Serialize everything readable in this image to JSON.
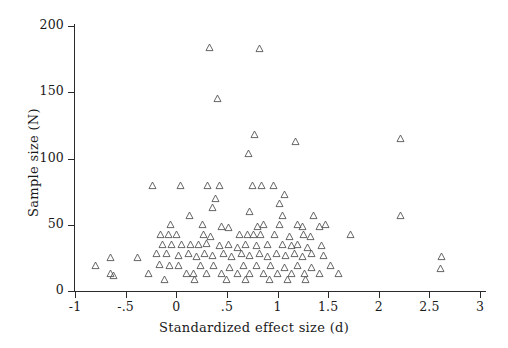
{
  "chart_data": {
    "type": "scatter",
    "title": "",
    "xlabel": "Standardized effect size (d)",
    "ylabel": "Sample size (N)",
    "xlim": [
      -1,
      3
    ],
    "ylim": [
      0,
      200
    ],
    "xticks": [
      -1,
      -0.5,
      0,
      0.5,
      1,
      1.5,
      2,
      2.5,
      3
    ],
    "xticklabels": [
      "-1",
      "-.5",
      "0",
      ".5",
      "1",
      "1.5",
      "2",
      "2.5",
      "3"
    ],
    "yticks": [
      0,
      50,
      100,
      150,
      200
    ],
    "yticklabels": [
      "0",
      "50",
      "100",
      "150",
      "200"
    ],
    "grid": false,
    "legend": false,
    "marker": "triangle-up-open",
    "marker_color": "#555555",
    "series": [
      {
        "name": "studies",
        "points": [
          [
            0.33,
            184
          ],
          [
            0.82,
            183
          ],
          [
            0.41,
            145
          ],
          [
            1.18,
            113
          ],
          [
            0.71,
            104
          ],
          [
            0.77,
            118
          ],
          [
            2.21,
            115
          ],
          [
            -0.23,
            80
          ],
          [
            0.04,
            80
          ],
          [
            0.31,
            80
          ],
          [
            0.43,
            80
          ],
          [
            0.75,
            80
          ],
          [
            0.84,
            80
          ],
          [
            0.96,
            80
          ],
          [
            1.07,
            73
          ],
          [
            1.02,
            66
          ],
          [
            0.39,
            70
          ],
          [
            0.36,
            63
          ],
          [
            0.13,
            57
          ],
          [
            0.72,
            60
          ],
          [
            1.05,
            57
          ],
          [
            1.36,
            57
          ],
          [
            2.21,
            57
          ],
          [
            -0.06,
            50
          ],
          [
            0.26,
            50
          ],
          [
            0.45,
            49
          ],
          [
            0.52,
            48
          ],
          [
            0.8,
            49
          ],
          [
            0.86,
            50
          ],
          [
            1.02,
            50
          ],
          [
            1.2,
            50
          ],
          [
            1.25,
            49
          ],
          [
            1.41,
            49
          ],
          [
            1.47,
            50
          ],
          [
            -0.16,
            43
          ],
          [
            -0.08,
            43
          ],
          [
            0.0,
            43
          ],
          [
            0.27,
            43
          ],
          [
            0.34,
            41
          ],
          [
            0.62,
            43
          ],
          [
            0.7,
            43
          ],
          [
            0.76,
            43
          ],
          [
            0.83,
            43
          ],
          [
            0.97,
            43
          ],
          [
            1.12,
            41
          ],
          [
            1.26,
            43
          ],
          [
            1.33,
            41
          ],
          [
            1.72,
            43
          ],
          [
            -0.14,
            35
          ],
          [
            -0.05,
            35
          ],
          [
            0.05,
            35
          ],
          [
            0.14,
            35
          ],
          [
            0.22,
            35
          ],
          [
            0.3,
            36
          ],
          [
            0.43,
            34
          ],
          [
            0.52,
            35
          ],
          [
            0.6,
            33
          ],
          [
            0.68,
            35
          ],
          [
            0.79,
            34
          ],
          [
            0.9,
            35
          ],
          [
            1.05,
            35
          ],
          [
            1.14,
            34
          ],
          [
            1.2,
            35
          ],
          [
            1.3,
            33
          ],
          [
            1.43,
            34
          ],
          [
            -0.2,
            28
          ],
          [
            -0.1,
            28
          ],
          [
            0.02,
            27
          ],
          [
            0.12,
            28
          ],
          [
            0.2,
            26
          ],
          [
            0.28,
            28
          ],
          [
            0.36,
            27
          ],
          [
            0.47,
            28
          ],
          [
            0.55,
            26
          ],
          [
            0.64,
            28
          ],
          [
            0.72,
            27
          ],
          [
            0.82,
            28
          ],
          [
            0.9,
            26
          ],
          [
            0.99,
            28
          ],
          [
            1.08,
            27
          ],
          [
            1.17,
            28
          ],
          [
            1.25,
            26
          ],
          [
            1.34,
            28
          ],
          [
            1.45,
            27
          ],
          [
            2.62,
            26
          ],
          [
            -0.8,
            19
          ],
          [
            -0.65,
            25
          ],
          [
            -0.65,
            13
          ],
          [
            -0.62,
            12
          ],
          [
            -0.38,
            25
          ],
          [
            -0.27,
            13
          ],
          [
            -0.17,
            20
          ],
          [
            -0.07,
            19
          ],
          [
            0.02,
            19
          ],
          [
            0.1,
            13
          ],
          [
            0.17,
            13
          ],
          [
            0.24,
            19
          ],
          [
            0.3,
            13
          ],
          [
            0.37,
            19
          ],
          [
            0.45,
            13
          ],
          [
            0.53,
            18
          ],
          [
            0.6,
            13
          ],
          [
            0.66,
            19
          ],
          [
            0.72,
            13
          ],
          [
            0.79,
            19
          ],
          [
            0.86,
            13
          ],
          [
            0.93,
            19
          ],
          [
            1.0,
            13
          ],
          [
            1.07,
            18
          ],
          [
            1.14,
            13
          ],
          [
            1.2,
            19
          ],
          [
            1.27,
            13
          ],
          [
            1.34,
            18
          ],
          [
            1.41,
            13
          ],
          [
            1.52,
            19
          ],
          [
            1.6,
            13
          ],
          [
            2.61,
            17
          ],
          [
            0.5,
            9
          ],
          [
            0.92,
            9
          ],
          [
            1.1,
            9
          ],
          [
            -0.12,
            9
          ],
          [
            0.18,
            9
          ],
          [
            0.68,
            9
          ],
          [
            1.28,
            9
          ]
        ]
      }
    ]
  }
}
